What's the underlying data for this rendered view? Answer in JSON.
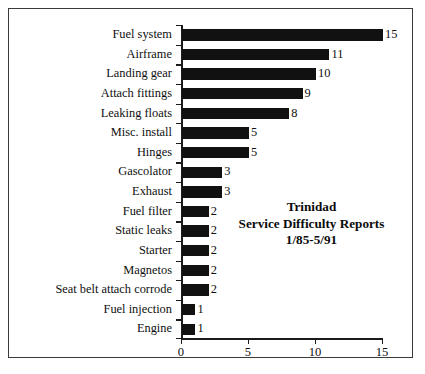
{
  "chart_data": {
    "type": "bar",
    "orientation": "horizontal",
    "title": "Trinidad Service Difficulty Reports 1/85-5/91",
    "title_lines": [
      "Trinidad",
      "Service Difficulty Reports",
      "1/85-5/91"
    ],
    "xlabel": "",
    "ylabel": "",
    "xlim": [
      0,
      15
    ],
    "x_ticks": [
      0,
      5,
      10,
      15
    ],
    "x_tick_labels": [
      "0",
      "5",
      "10",
      "15"
    ],
    "grid": false,
    "legend": false,
    "bar_color": "#111111",
    "frame_color": "#3a3a3a",
    "axis_color": "#1b1b1b",
    "categories": [
      "Fuel system",
      "Airframe",
      "Landing gear",
      "Attach fittings",
      "Leaking floats",
      "Misc. install",
      "Hinges",
      "Gascolator",
      "Exhaust",
      "Fuel filter",
      "Static leaks",
      "Starter",
      "Magnetos",
      "Seat belt attach corrode",
      "Fuel injection",
      "Engine"
    ],
    "values": [
      15,
      11,
      10,
      9,
      8,
      5,
      5,
      3,
      3,
      2,
      2,
      2,
      2,
      2,
      1,
      1
    ],
    "value_labels": [
      "15",
      "11",
      "10",
      "9",
      "8",
      "5",
      "5",
      "3",
      "3",
      "2",
      "2",
      "2",
      "2",
      "2",
      "1",
      "1"
    ]
  }
}
